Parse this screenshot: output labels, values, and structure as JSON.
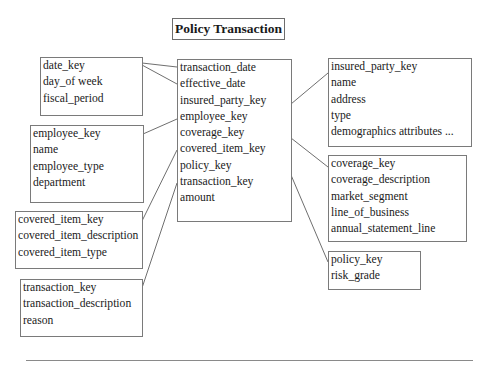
{
  "title": "Policy Transaction",
  "fact_table": {
    "name": "policy-transaction-fact",
    "fields": [
      "transaction_date",
      "effective_date",
      "insured_party_key",
      "employee_key",
      "coverage_key",
      "covered_item_key",
      "policy_key",
      "transaction_key",
      "amount"
    ]
  },
  "dimensions": {
    "date": {
      "fields": [
        "date_key",
        "day_of week",
        "fiscal_period"
      ]
    },
    "employee": {
      "fields": [
        "employee_key",
        "name",
        "employee_type",
        "department"
      ]
    },
    "covered_item": {
      "fields": [
        "covered_item_key",
        "covered_item_description",
        "covered_item_type"
      ]
    },
    "transaction": {
      "fields": [
        "transaction_key",
        "transaction_description",
        "reason"
      ]
    },
    "insured_party": {
      "fields": [
        "insured_party_key",
        "name",
        "address",
        "type",
        "demographics attributes ..."
      ]
    },
    "coverage": {
      "fields": [
        "coverage_key",
        "coverage_description",
        "market_segment",
        "line_of_business",
        "annual_statement_line"
      ]
    },
    "policy": {
      "fields": [
        "policy_key",
        "risk_grade"
      ]
    }
  },
  "colors": {
    "border": "#7a7a7a",
    "line": "#6f6f6f",
    "text": "#1a1a1a"
  }
}
